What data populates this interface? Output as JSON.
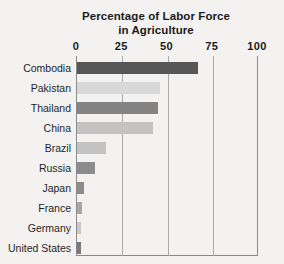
{
  "chart_data": {
    "type": "bar",
    "orientation": "horizontal",
    "title": "Percentage of Labor Force in Agriculture",
    "title_lines": [
      "Percentage of Labor Force",
      "in Agriculture"
    ],
    "xlabel": "",
    "ylabel": "",
    "xlim": [
      0,
      100
    ],
    "xticks": [
      0,
      25,
      50,
      75,
      100
    ],
    "xtick_labels": [
      "0",
      "25",
      "50",
      "75",
      "100"
    ],
    "grid": true,
    "legend": false,
    "categories": [
      "Combodia",
      "Pakistan",
      "Thailand",
      "China",
      "Brazil",
      "Russia",
      "Japan",
      "France",
      "Germany",
      "United States"
    ],
    "values": [
      67,
      46,
      45,
      42,
      16,
      10,
      4,
      3,
      2,
      2
    ],
    "bar_colors": [
      "#575757",
      "#d8d8d8",
      "#848484",
      "#c3c3c3",
      "#c3c3c3",
      "#8c8c8c",
      "#8c8c8c",
      "#a6a6a6",
      "#c9c9c9",
      "#7a7a7a"
    ]
  },
  "style": {
    "background": "#f3f2f0",
    "axis_color": "#8a8a8a",
    "grid_color": "#a9a9a9",
    "text_color": "#1b1b1b"
  }
}
